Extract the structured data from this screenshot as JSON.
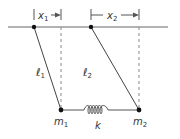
{
  "diagram": {
    "colors": {
      "line": "#555555",
      "dashed": "#888888",
      "dot": "#111111",
      "text": "#333333"
    },
    "labels": {
      "x1": {
        "base": "x",
        "sub": "1"
      },
      "x2": {
        "base": "x",
        "sub": "2"
      },
      "l1": {
        "base": "ℓ",
        "sub": "1"
      },
      "l2": {
        "base": "ℓ",
        "sub": "2"
      },
      "m1": {
        "base": "m",
        "sub": "1"
      },
      "m2": {
        "base": "m",
        "sub": "2"
      },
      "k": "k"
    }
  }
}
